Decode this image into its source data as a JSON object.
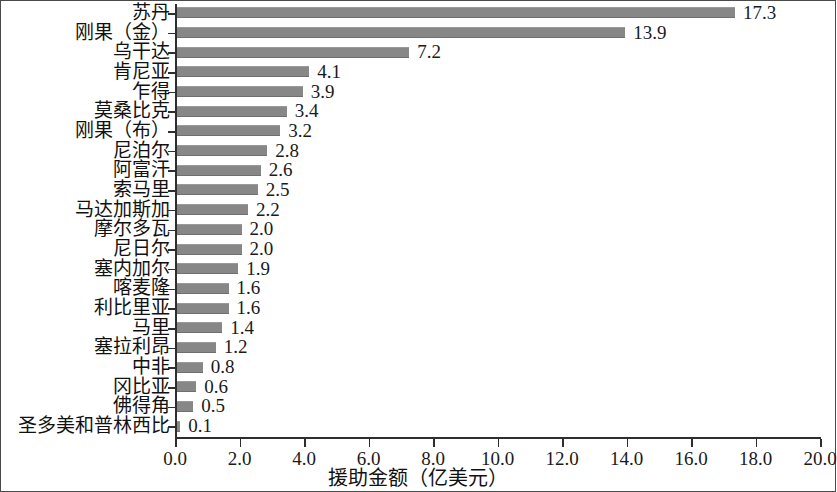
{
  "chart_data": {
    "type": "bar",
    "orientation": "horizontal",
    "title": "",
    "subtitle": "",
    "xlabel": "援助金额（亿美元）",
    "ylabel": "",
    "xlim": [
      0.0,
      20.0
    ],
    "xtick_labels": [
      "0.0",
      "2.0",
      "4.0",
      "6.0",
      "8.0",
      "10.0",
      "12.0",
      "14.0",
      "16.0",
      "18.0",
      "20.0"
    ],
    "xticks": [
      0.0,
      2.0,
      4.0,
      6.0,
      8.0,
      10.0,
      12.0,
      14.0,
      16.0,
      18.0,
      20.0
    ],
    "grid": false,
    "legend": false,
    "legend_position": "none",
    "bar_color": "#878787",
    "categories": [
      "苏丹",
      "刚果（金）",
      "乌干达",
      "肯尼亚",
      "乍得",
      "莫桑比克",
      "刚果（布）",
      "尼泊尔",
      "阿富汗",
      "索马里",
      "马达加斯加",
      "摩尔多瓦",
      "尼日尔",
      "塞内加尔",
      "喀麦隆",
      "利比里亚",
      "马里",
      "塞拉利昂",
      "中非",
      "冈比亚",
      "佛得角",
      "圣多美和普林西比"
    ],
    "values": [
      17.3,
      13.9,
      7.2,
      4.1,
      3.9,
      3.4,
      3.2,
      2.8,
      2.6,
      2.5,
      2.2,
      2.0,
      2.0,
      1.9,
      1.6,
      1.6,
      1.4,
      1.2,
      0.8,
      0.6,
      0.5,
      0.1
    ],
    "value_labels": [
      "17.3",
      "13.9",
      "7.2",
      "4.1",
      "3.9",
      "3.4",
      "3.2",
      "2.8",
      "2.6",
      "2.5",
      "2.2",
      "2.0",
      "2.0",
      "1.9",
      "1.6",
      "1.6",
      "1.4",
      "1.2",
      "0.8",
      "0.6",
      "0.5",
      "0.1"
    ]
  }
}
